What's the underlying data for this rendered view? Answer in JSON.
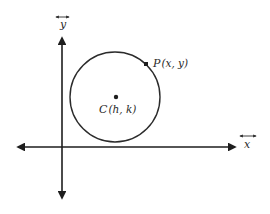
{
  "diagram": {
    "axes": {
      "x_label": "x",
      "y_label": "y",
      "x_label_overarrow": "double-headed-arrow",
      "y_label_overarrow": "double-headed-arrow"
    },
    "points": {
      "center": {
        "name": "C",
        "label": "C (h, k)",
        "letter": "C",
        "coords": "(h, k)"
      },
      "on_circle": {
        "name": "P",
        "label": "P (x, y)",
        "letter": "P",
        "coords": "(x, y)"
      }
    },
    "colors": {
      "ink": "#1e1e1e",
      "background": "#ffffff"
    }
  }
}
